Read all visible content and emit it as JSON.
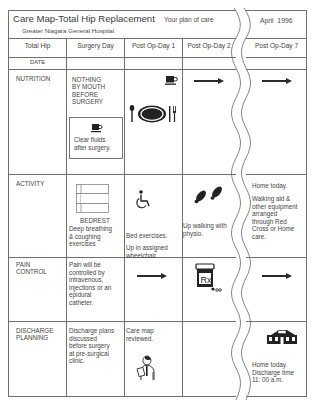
{
  "header": {
    "title": "Care Map-Total Hip Replacement",
    "subtitle_right": "Your plan of care",
    "hospital": "Greater Niagara General Hospital",
    "date": "April  1996"
  },
  "columns": [
    "Total Hip",
    "Surgery Day",
    "Post Op-Day 1",
    "Post Op-Day 2",
    "Post Op-Day 7"
  ],
  "date_row_label": "DATE",
  "rows": {
    "nutrition": {
      "label": "NUTRITION",
      "surgery_day": [
        "NOTHING",
        "BY MOUTH",
        "BEFORE",
        "SURGERY"
      ],
      "surgery_day_box": [
        "Clear fluids",
        "after surgery."
      ],
      "post_op_1_icons": [
        "coffee-cup-icon",
        "place-setting-icon"
      ],
      "post_op_2": "continue-arrow",
      "post_op_7": "continue-arrow"
    },
    "activity": {
      "label": "ACTIVITY",
      "surgery_day_icon_label": "BEDREST",
      "surgery_day": [
        "Deep breathing",
        "& coughing",
        "exercises"
      ],
      "post_op_1_a": "Bed exercises.",
      "post_op_1_b": [
        "Up in assigned",
        "wheelchair."
      ],
      "post_op_2": [
        "Up walking with",
        "physio."
      ],
      "post_op_7_a": "Home today.",
      "post_op_7_b": [
        "Walking aid &",
        "other equipment",
        "arranged",
        "through Red",
        "Cross or Home",
        "care."
      ]
    },
    "pain_control": {
      "label": [
        "PAIN",
        "CONTROL"
      ],
      "surgery_day": [
        "Pain will be",
        "controlled by",
        "intravenous,",
        "injections or an",
        "epidural",
        "catheter."
      ],
      "post_op_1": "continue-arrow",
      "post_op_2_icon": "prescription-bottle-icon",
      "post_op_2_icon_text": "Rx",
      "post_op_7": "continue-arrow"
    },
    "discharge_planning": {
      "label": [
        "DISCHARGE",
        "PLANNING"
      ],
      "surgery_day": [
        "Discharge plans",
        "discussed",
        "before surgery",
        "at pre-surgical",
        "clinic."
      ],
      "post_op_1": [
        "Care map",
        "reviewed."
      ],
      "post_op_1_icon": "doctor-icon",
      "post_op_7_icon": "house-icon",
      "post_op_7": [
        "Home today.",
        "Discharge time",
        "11: 00 a.m."
      ]
    }
  },
  "colors": {
    "line": "#6f6f6f",
    "text": "#444444",
    "icon": "#222222",
    "background": "#ffffff"
  }
}
